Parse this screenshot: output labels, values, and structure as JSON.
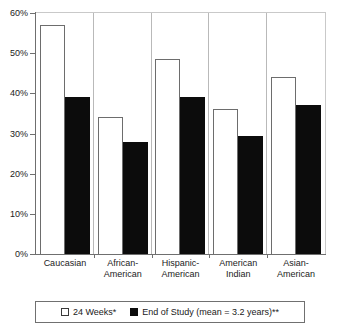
{
  "chart_data": {
    "type": "bar",
    "title": "",
    "xlabel": "",
    "ylabel": "",
    "ylim": [
      0,
      60
    ],
    "ytick_labels": [
      "60%",
      "50%",
      "40%",
      "30%",
      "20%",
      "10%",
      "0%"
    ],
    "ytick_values": [
      60,
      50,
      40,
      30,
      20,
      10,
      0
    ],
    "grid": false,
    "legend_position": "bottom",
    "categories": [
      "Caucasian",
      "African-American",
      "Hispanic-American",
      "American Indian",
      "Asian-American"
    ],
    "category_lines": [
      [
        "Caucasian"
      ],
      [
        "African-",
        "American"
      ],
      [
        "Hispanic-",
        "American"
      ],
      [
        "American",
        "Indian"
      ],
      [
        "Asian-",
        "American"
      ]
    ],
    "series": [
      {
        "name": "24 Weeks*",
        "color": "#ffffff",
        "values": [
          57,
          34,
          48.5,
          36,
          44
        ]
      },
      {
        "name": "End of Study (mean = 3.2 years)**",
        "color": "#0c0c0c",
        "values": [
          39,
          28,
          39,
          29.5,
          37
        ]
      }
    ]
  },
  "legend": {
    "items": [
      {
        "label": "24 Weeks*",
        "swatch": "white-square-icon"
      },
      {
        "label": "End of Study (mean = 3.2 years)**",
        "swatch": "black-square-icon"
      }
    ]
  }
}
